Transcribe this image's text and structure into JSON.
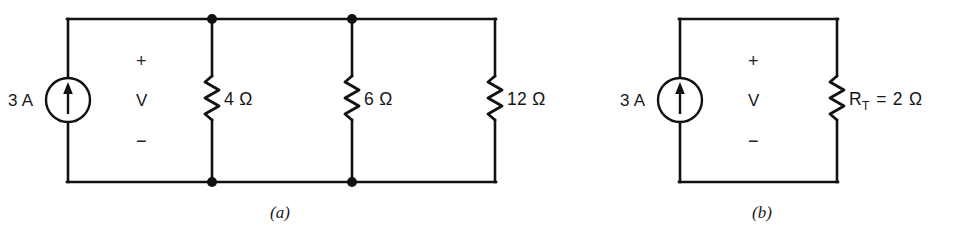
{
  "figure": {
    "ink_color": "#111111",
    "background": "#ffffff"
  },
  "circuit_a": {
    "caption": "(a)",
    "source": {
      "label": "3 A",
      "symbol": "current-source",
      "arrow_direction": "up"
    },
    "voltage_label": {
      "plus": "+",
      "name": "V",
      "minus": "−"
    },
    "resistors": [
      {
        "label": "4 Ω",
        "value": 4,
        "unit": "Ω"
      },
      {
        "label": "6 Ω",
        "value": 6,
        "unit": "Ω"
      },
      {
        "label": "12 Ω",
        "value": 12,
        "unit": "Ω"
      }
    ],
    "nodes": 2
  },
  "circuit_b": {
    "caption": "(b)",
    "source": {
      "label": "3 A",
      "symbol": "current-source",
      "arrow_direction": "up"
    },
    "voltage_label": {
      "plus": "+",
      "name": "V",
      "minus": "−"
    },
    "resistor": {
      "symbol": "R",
      "subscript": "T",
      "equals": "=",
      "value": "2",
      "unit": "Ω",
      "label": "R_T = 2 Ω"
    }
  }
}
